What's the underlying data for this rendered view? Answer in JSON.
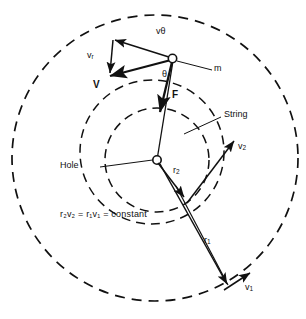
{
  "figure": {
    "colors": {
      "ink": "#111111",
      "background": "#ffffff"
    },
    "circles": {
      "outer_orbit": {
        "name": "outer-orbit-circle",
        "cx": 155,
        "cy": 158,
        "r": 143,
        "style": "dashed"
      },
      "inner_orbit": {
        "name": "inner-orbit-circle",
        "cx": 157,
        "cy": 160,
        "r": 52,
        "style": "dashed"
      },
      "mid_orbit": {
        "name": "mid-orbit-circle",
        "cx": 152,
        "cy": 152,
        "r": 72,
        "style": "dashed"
      }
    },
    "points": {
      "mass": {
        "name": "mass-point",
        "x": 172,
        "y": 59
      },
      "hole": {
        "name": "hole-point",
        "x": 157,
        "y": 160
      }
    },
    "labels": {
      "v_theta": "vθ",
      "v_r": "v",
      "v_r_sub": "r",
      "V": "V",
      "theta": "θ",
      "F": "F",
      "m": "m",
      "string": "String",
      "hole": "Hole",
      "r2": "r",
      "r2_sub": "2",
      "v2": "v",
      "v2_sub": "2",
      "r1": "r",
      "r1_sub": "1",
      "v1": "v",
      "v1_sub": "1",
      "equation": "r₂v₂ = r₁v₁ = constant"
    },
    "equation_parts": {
      "r2v2": "r₂v₂",
      "eq1": "=",
      "r1v1": "r₁v₁",
      "eq2": "=",
      "constant": "constant"
    },
    "vectors": [
      {
        "name": "v-theta-vector",
        "label": "vθ",
        "from": [
          172,
          59
        ],
        "to": [
          113,
          40
        ],
        "desc": "tangential velocity component"
      },
      {
        "name": "v-r-vector",
        "label": "vr",
        "from": [
          113,
          40
        ],
        "to": [
          110,
          75
        ],
        "desc": "radial velocity component"
      },
      {
        "name": "V-vector",
        "label": "V",
        "from": [
          172,
          59
        ],
        "to": [
          111,
          76
        ],
        "desc": "resultant velocity"
      },
      {
        "name": "F-vector",
        "label": "F",
        "from": [
          172,
          62
        ],
        "to": [
          159,
          110
        ],
        "desc": "centripetal force along string"
      },
      {
        "name": "r2-vector",
        "label": "r2",
        "from": [
          157,
          160
        ],
        "to": [
          183,
          196
        ],
        "desc": "inner radius"
      },
      {
        "name": "v2-vector",
        "label": "v2",
        "from": [
          189,
          203
        ],
        "to": [
          235,
          140
        ],
        "desc": "speed at inner radius"
      },
      {
        "name": "r1-vector",
        "label": "r1",
        "from": [
          177,
          189
        ],
        "to": [
          228,
          285
        ],
        "desc": "outer radius"
      },
      {
        "name": "v1-vector",
        "label": "v1",
        "from": [
          222,
          289
        ],
        "to": [
          251,
          272
        ],
        "desc": "speed at outer radius"
      }
    ],
    "leaders": [
      {
        "name": "m-leader-line",
        "from": [
          177,
          61
        ],
        "to": [
          212,
          70
        ]
      },
      {
        "name": "string-leader-line",
        "from": [
          185,
          133
        ],
        "to": [
          221,
          117
        ]
      },
      {
        "name": "hole-leader-line",
        "from": [
          100,
          167
        ],
        "to": [
          153,
          160
        ]
      }
    ]
  }
}
